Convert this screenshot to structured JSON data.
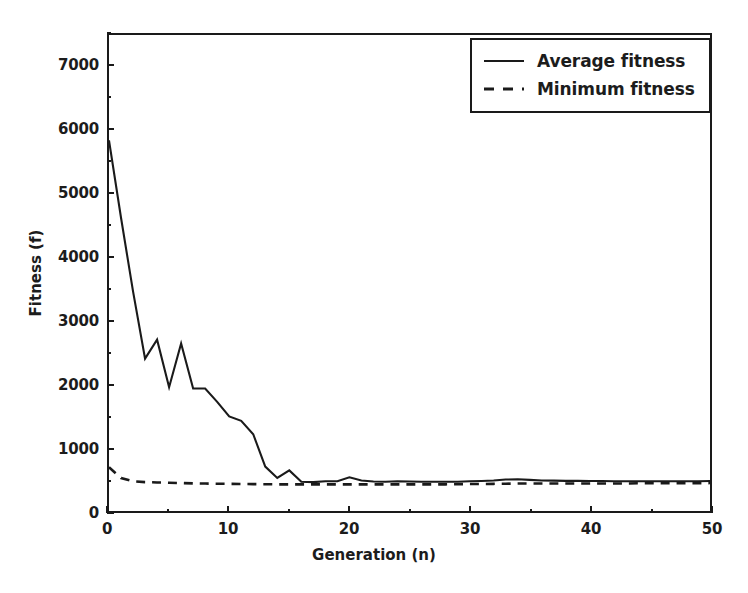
{
  "chart_data": {
    "type": "line",
    "title": "",
    "xlabel": "Generation (n)",
    "ylabel": "Fitness (f)",
    "xlim": [
      0,
      50
    ],
    "ylim": [
      0,
      7500
    ],
    "xticks": [
      "0",
      "10",
      "20",
      "30",
      "40",
      "50"
    ],
    "xtick_values": [
      0,
      10,
      20,
      30,
      40,
      50
    ],
    "yticks": [
      "0",
      "1000",
      "2000",
      "3000",
      "4000",
      "5000",
      "6000",
      "7000"
    ],
    "ytick_values": [
      0,
      1000,
      2000,
      3000,
      4000,
      5000,
      6000,
      7000
    ],
    "grid": false,
    "legend_position": "upper right",
    "x": [
      0,
      1,
      2,
      3,
      4,
      5,
      6,
      7,
      8,
      9,
      10,
      11,
      12,
      13,
      14,
      15,
      16,
      17,
      18,
      19,
      20,
      21,
      22,
      23,
      24,
      25,
      26,
      27,
      28,
      29,
      30,
      31,
      32,
      33,
      34,
      35,
      36,
      37,
      38,
      39,
      40,
      41,
      42,
      43,
      44,
      45,
      46,
      47,
      48,
      49,
      50
    ],
    "series": [
      {
        "name": "Average fitness",
        "style": "solid",
        "color": "#1a1a1a",
        "values": [
          5840,
          4620,
          3460,
          2400,
          2700,
          1950,
          2640,
          1930,
          1930,
          1720,
          1490,
          1420,
          1210,
          700,
          520,
          640,
          460,
          455,
          470,
          470,
          530,
          480,
          465,
          462,
          470,
          465,
          462,
          460,
          460,
          462,
          468,
          472,
          480,
          495,
          500,
          490,
          480,
          478,
          475,
          474,
          472,
          472,
          470,
          470,
          470,
          470,
          470,
          470,
          470,
          470,
          472
        ]
      },
      {
        "name": "Minimum fitness",
        "style": "dashed",
        "color": "#1a1a1a",
        "values": [
          690,
          520,
          470,
          455,
          450,
          445,
          440,
          435,
          432,
          430,
          428,
          426,
          424,
          422,
          420,
          420,
          420,
          420,
          420,
          420,
          420,
          420,
          420,
          420,
          420,
          420,
          420,
          420,
          420,
          422,
          424,
          426,
          428,
          430,
          432,
          432,
          432,
          432,
          432,
          432,
          434,
          434,
          434,
          434,
          436,
          436,
          436,
          436,
          438,
          438,
          440
        ]
      }
    ],
    "legend": [
      {
        "label": "Average fitness",
        "style": "solid"
      },
      {
        "label": "Minimum fitness",
        "style": "dashed"
      }
    ]
  }
}
